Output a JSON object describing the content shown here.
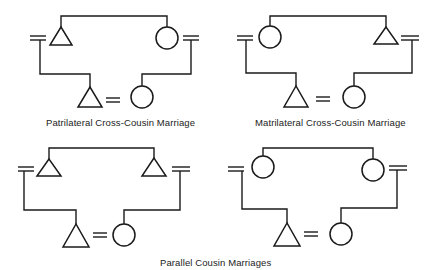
{
  "figure": {
    "colors": {
      "line": "#1a1a1a",
      "background": "#ffffff",
      "text": "#222222"
    },
    "legend": {
      "triangle": "male",
      "circle": "female",
      "double-line": "marriage",
      "bracket-line": "sibling/descent link"
    },
    "panels": [
      {
        "id": "patrilateral",
        "caption": "Patrilateral Cross-Cousin Marriage",
        "parents": [
          {
            "sex": "male",
            "symbol": "triangle",
            "spouse_mark": "left"
          },
          {
            "sex": "female",
            "symbol": "circle",
            "spouse_mark": "right"
          }
        ],
        "couple": [
          {
            "sex": "male",
            "symbol": "triangle"
          },
          {
            "sex": "female",
            "symbol": "circle"
          }
        ]
      },
      {
        "id": "matrilateral",
        "caption": "Matrilateral Cross-Cousin Marriage",
        "parents": [
          {
            "sex": "female",
            "symbol": "circle",
            "spouse_mark": "left"
          },
          {
            "sex": "male",
            "symbol": "triangle",
            "spouse_mark": "right"
          }
        ],
        "couple": [
          {
            "sex": "male",
            "symbol": "triangle"
          },
          {
            "sex": "female",
            "symbol": "circle"
          }
        ]
      },
      {
        "id": "parallel-patri",
        "caption": "",
        "parents": [
          {
            "sex": "male",
            "symbol": "triangle",
            "spouse_mark": "left"
          },
          {
            "sex": "male",
            "symbol": "triangle",
            "spouse_mark": "right"
          }
        ],
        "couple": [
          {
            "sex": "male",
            "symbol": "triangle"
          },
          {
            "sex": "female",
            "symbol": "circle"
          }
        ]
      },
      {
        "id": "parallel-matri",
        "caption": "",
        "parents": [
          {
            "sex": "female",
            "symbol": "circle",
            "spouse_mark": "left"
          },
          {
            "sex": "female",
            "symbol": "circle",
            "spouse_mark": "right"
          }
        ],
        "couple": [
          {
            "sex": "male",
            "symbol": "triangle"
          },
          {
            "sex": "female",
            "symbol": "circle"
          }
        ]
      }
    ],
    "group_caption": "Parallel Cousin Marriages"
  }
}
